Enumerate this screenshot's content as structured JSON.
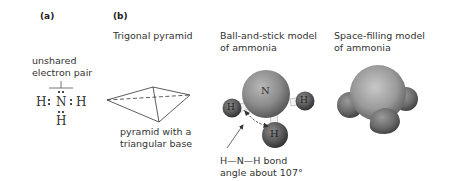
{
  "panel_a": {
    "label": "(a)",
    "annotation": "unshared electron pair",
    "annotation_lines": [
      "unshared",
      "electron pair"
    ],
    "lewis": {
      "left_h": "H",
      "center_n": "N",
      "right_h": "H",
      "bottom_h": "H"
    }
  },
  "panel_b": {
    "label": "(b)",
    "pyramid": {
      "title": "Trigonal pyramid",
      "caption_lines": [
        "pyramid with a",
        "triangular base"
      ]
    },
    "ball_and_stick": {
      "title_lines": [
        "Ball-and-stick model",
        "of ammonia"
      ],
      "atoms": {
        "center": "N",
        "left": "H",
        "right": "H",
        "bottom": "H"
      },
      "angle_caption_lines": [
        "H—N—H bond",
        "angle about 107°"
      ]
    },
    "space_filling": {
      "title_lines": [
        "Space-filling model",
        "of ammonia"
      ]
    }
  },
  "colors": {
    "text": "#333333",
    "atom_n": "#8a8a8a",
    "atom_h": "#555555",
    "bond": "#f0f0f0",
    "arrow": "#444444"
  }
}
